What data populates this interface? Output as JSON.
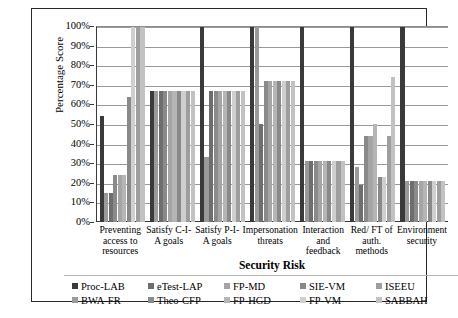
{
  "chart_data": {
    "type": "bar",
    "title": "",
    "xlabel": "Security Risk",
    "ylabel": "Percentage Score",
    "ylim": [
      0,
      100
    ],
    "ytick_labels": [
      "0%",
      "10%",
      "20%",
      "30%",
      "40%",
      "50%",
      "60%",
      "70%",
      "80%",
      "90%",
      "100%"
    ],
    "ytick_values": [
      0,
      10,
      20,
      30,
      40,
      50,
      60,
      70,
      80,
      90,
      100
    ],
    "grid": true,
    "legend_position": "bottom",
    "categories": [
      "Preventing access to resources",
      "Satisfy C-I-A goals",
      "Satisfy P-I-A goals",
      "Impersonation threats",
      "Interaction and feedback",
      "Red/ FT of auth. methods",
      "Environment security"
    ],
    "series": [
      {
        "name": "Proc-LAB",
        "color": "#3a3a3a",
        "values": [
          54,
          67,
          100,
          100,
          100,
          100,
          100
        ]
      },
      {
        "name": "BWA-FR",
        "color": "#9a9a9a",
        "values": [
          15,
          67,
          33,
          100,
          31,
          28,
          21
        ]
      },
      {
        "name": "eTest-LAP",
        "color": "#6e6e6e",
        "values": [
          15,
          67,
          67,
          50,
          31,
          19,
          21
        ]
      },
      {
        "name": "Theo-CFP",
        "color": "#8a8a8a",
        "values": [
          24,
          67,
          67,
          72,
          31,
          44,
          21
        ]
      },
      {
        "name": "FP-MD",
        "color": "#a5a5a5",
        "values": [
          24,
          67,
          67,
          72,
          31,
          44,
          21
        ]
      },
      {
        "name": "FP-HGD",
        "color": "#b5b5b5",
        "values": [
          24,
          67,
          67,
          72,
          31,
          50,
          21
        ]
      },
      {
        "name": "SIE-VM",
        "color": "#898989",
        "values": [
          64,
          67,
          67,
          72,
          31,
          23,
          21
        ]
      },
      {
        "name": "FP-VM",
        "color": "#cfcfcf",
        "values": [
          100,
          67,
          67,
          72,
          31,
          23,
          21
        ]
      },
      {
        "name": "ISEEU",
        "color": "#9e9e9e",
        "values": [
          100,
          67,
          67,
          72,
          31,
          44,
          21
        ]
      },
      {
        "name": "SABBAH",
        "color": "#c2c2c2",
        "values": [
          100,
          67,
          67,
          72,
          31,
          74,
          21
        ]
      }
    ]
  }
}
